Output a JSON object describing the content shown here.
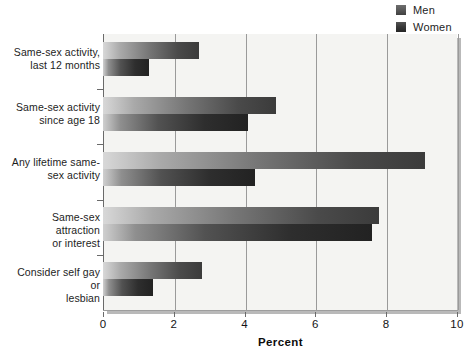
{
  "chart_data": {
    "type": "bar",
    "orientation": "horizontal",
    "title": "",
    "xlabel": "Percent",
    "ylabel": "",
    "xlim": [
      0,
      10
    ],
    "xticks": [
      "0",
      "2",
      "4",
      "6",
      "8",
      "10"
    ],
    "grid": "vertical",
    "legend_position": "top-right",
    "categories": [
      "Same-sex activity, last 12 months",
      "Same-sex activity since age 18",
      "Any lifetime same-sex activity",
      "Same-sex attraction or interest",
      "Consider self gay or lesbian"
    ],
    "category_lines": [
      [
        "Same-sex activity,",
        "last 12 months"
      ],
      [
        "Same-sex activity",
        "since age 18"
      ],
      [
        "Any lifetime same-",
        "sex activity"
      ],
      [
        "Same-sex attraction",
        "or interest"
      ],
      [
        "Consider self gay or",
        "lesbian"
      ]
    ],
    "series": [
      {
        "name": "Men",
        "color": "#5b5b5b",
        "values": [
          2.7,
          4.9,
          9.1,
          7.8,
          2.8
        ]
      },
      {
        "name": "Women",
        "color": "#2e2e2e",
        "values": [
          1.3,
          4.1,
          4.3,
          7.6,
          1.4
        ]
      }
    ]
  },
  "legend": {
    "items": [
      {
        "label": "Men"
      },
      {
        "label": "Women"
      }
    ]
  },
  "axis": {
    "x_title": "Percent"
  }
}
